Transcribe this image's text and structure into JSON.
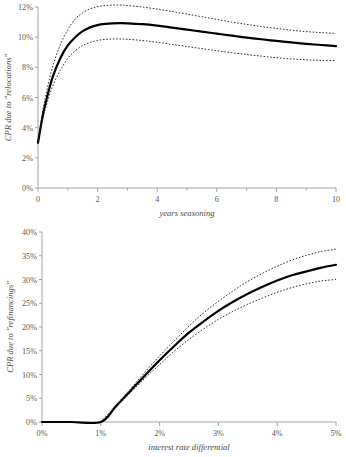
{
  "chart_data": [
    {
      "id": "relocations",
      "type": "line",
      "title": "",
      "xlabel": "years seasoning",
      "ylabel": "CPR due to \"relocations\"",
      "xlim": [
        0,
        10
      ],
      "ylim": [
        0,
        12
      ],
      "xticks": [
        0,
        1,
        2,
        3,
        4,
        5,
        6,
        7,
        8,
        9,
        10
      ],
      "xtick_labels": [
        "0",
        "",
        "2",
        "",
        "4",
        "",
        "6",
        "",
        "8",
        "",
        "10"
      ],
      "yticks": [
        0,
        2,
        4,
        6,
        8,
        10,
        12
      ],
      "ytick_labels": [
        "0%",
        "2%",
        "4%",
        "6%",
        "8%",
        "10%",
        "12%"
      ],
      "grid": false,
      "legend": "none",
      "series": [
        {
          "name": "central estimate",
          "style": "solid",
          "x": [
            0,
            0.15,
            0.3,
            0.5,
            0.75,
            1.0,
            1.25,
            1.5,
            1.75,
            2.0,
            2.25,
            2.5,
            2.75,
            3.0,
            3.5,
            4.0,
            4.5,
            5.0,
            5.5,
            6.0,
            6.5,
            7.0,
            7.5,
            8.0,
            8.5,
            9.0,
            9.5,
            10.0
          ],
          "values": [
            3.0,
            4.7,
            6.0,
            7.4,
            8.6,
            9.45,
            10.0,
            10.4,
            10.65,
            10.8,
            10.88,
            10.92,
            10.93,
            10.92,
            10.86,
            10.76,
            10.63,
            10.5,
            10.37,
            10.23,
            10.1,
            9.97,
            9.86,
            9.75,
            9.65,
            9.56,
            9.48,
            9.4
          ]
        },
        {
          "name": "upper confidence band",
          "style": "dotted",
          "x": [
            0,
            0.15,
            0.3,
            0.5,
            0.75,
            1.0,
            1.25,
            1.5,
            1.75,
            2.0,
            2.25,
            2.5,
            2.75,
            3.0,
            3.5,
            4.0,
            4.5,
            5.0,
            5.5,
            6.0,
            6.5,
            7.0,
            7.5,
            8.0,
            8.5,
            9.0,
            9.5,
            10.0
          ],
          "values": [
            3.05,
            5.0,
            6.5,
            8.1,
            9.5,
            10.5,
            11.2,
            11.62,
            11.88,
            12.02,
            12.1,
            12.13,
            12.13,
            12.1,
            12.0,
            11.86,
            11.7,
            11.53,
            11.35,
            11.18,
            11.0,
            10.85,
            10.7,
            10.58,
            10.46,
            10.37,
            10.3,
            10.25
          ]
        },
        {
          "name": "lower confidence band",
          "style": "dotted",
          "x": [
            0,
            0.15,
            0.3,
            0.5,
            0.75,
            1.0,
            1.25,
            1.5,
            1.75,
            2.0,
            2.25,
            2.5,
            2.75,
            3.0,
            3.5,
            4.0,
            4.5,
            5.0,
            5.5,
            6.0,
            6.5,
            7.0,
            7.5,
            8.0,
            8.5,
            9.0,
            9.5,
            10.0
          ],
          "values": [
            2.95,
            4.5,
            5.6,
            6.8,
            7.8,
            8.6,
            9.1,
            9.45,
            9.65,
            9.78,
            9.85,
            9.88,
            9.88,
            9.86,
            9.78,
            9.66,
            9.52,
            9.38,
            9.24,
            9.1,
            8.97,
            8.85,
            8.74,
            8.64,
            8.56,
            8.5,
            8.46,
            8.45
          ]
        }
      ]
    },
    {
      "id": "refinancings",
      "type": "line",
      "title": "",
      "xlabel": "interest rate differential",
      "ylabel": "CPR due to \"refinancings\"",
      "xlim": [
        0,
        5
      ],
      "ylim": [
        0,
        40
      ],
      "xticks": [
        0,
        1,
        2,
        3,
        4,
        5
      ],
      "xtick_labels": [
        "0%",
        "1%",
        "2%",
        "3%",
        "4%",
        "5%"
      ],
      "yticks": [
        0,
        5,
        10,
        15,
        20,
        25,
        30,
        35,
        40
      ],
      "ytick_labels": [
        "0%",
        "5%",
        "10%",
        "15%",
        "20%",
        "25%",
        "30%",
        "35%",
        "40%"
      ],
      "grid": false,
      "legend": "none",
      "series": [
        {
          "name": "central estimate",
          "style": "solid",
          "x": [
            0,
            0.5,
            1.0,
            1.25,
            1.5,
            1.75,
            2.0,
            2.25,
            2.5,
            2.75,
            3.0,
            3.25,
            3.5,
            3.75,
            4.0,
            4.25,
            4.5,
            4.75,
            5.0
          ],
          "values": [
            0,
            0,
            0,
            3.2,
            6.5,
            9.8,
            13.0,
            16.0,
            18.8,
            21.2,
            23.4,
            25.3,
            27.0,
            28.5,
            29.8,
            30.9,
            31.7,
            32.5,
            33.1
          ]
        },
        {
          "name": "upper confidence band",
          "style": "dotted",
          "x": [
            1.0,
            1.25,
            1.5,
            1.75,
            2.0,
            2.25,
            2.5,
            2.75,
            3.0,
            3.25,
            3.5,
            3.75,
            4.0,
            4.25,
            4.5,
            4.75,
            5.0
          ],
          "values": [
            0,
            3.4,
            6.9,
            10.5,
            13.9,
            17.1,
            20.2,
            23.0,
            25.4,
            27.6,
            29.6,
            31.3,
            32.8,
            34.1,
            35.1,
            35.9,
            36.4
          ]
        },
        {
          "name": "lower confidence band",
          "style": "dotted",
          "x": [
            1.0,
            1.25,
            1.5,
            1.75,
            2.0,
            2.25,
            2.5,
            2.75,
            3.0,
            3.25,
            3.5,
            3.75,
            4.0,
            4.25,
            4.5,
            4.75,
            5.0
          ],
          "values": [
            0,
            3.0,
            6.1,
            9.2,
            12.1,
            14.9,
            17.4,
            19.6,
            21.6,
            23.3,
            24.8,
            26.1,
            27.3,
            28.3,
            29.1,
            29.7,
            30.0
          ]
        }
      ]
    }
  ]
}
